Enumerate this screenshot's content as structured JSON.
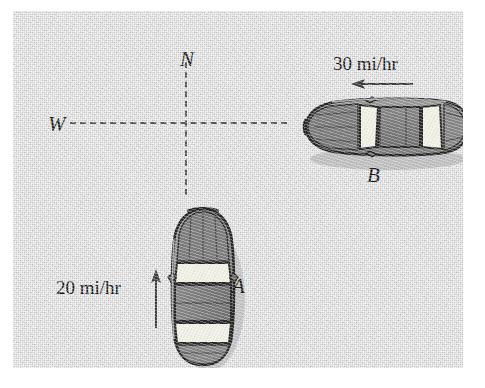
{
  "figure": {
    "type": "physics-diagram",
    "background_color": "#d2d2d2",
    "ink_color": "#181818"
  },
  "compass": {
    "north_label": "N",
    "west_label": "W"
  },
  "axes": {
    "horizontal_style": "dashed",
    "vertical_style": "dashed",
    "dash_color": "#585858"
  },
  "cars": [
    {
      "id": "car-a",
      "label": "A",
      "orientation": "facing-north",
      "speed_text": "20 mi/hr",
      "arrow_direction": "up",
      "body_color": "#8a8a8a",
      "outline_color": "#262626",
      "glass_color": "#f0efe6"
    },
    {
      "id": "car-b",
      "label": "B",
      "orientation": "facing-west",
      "speed_text": "30 mi/hr",
      "arrow_direction": "left",
      "body_color": "#8a8a8a",
      "outline_color": "#262626",
      "glass_color": "#f0efe6"
    }
  ]
}
